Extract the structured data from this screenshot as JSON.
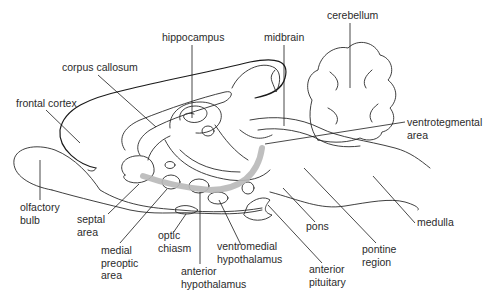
{
  "diagram": {
    "type": "labeled anatomical line drawing (sagittal brain section)",
    "pathway_color": "#b8b8b8",
    "line_color": "#2a2a2a",
    "labels": {
      "cerebellum": [
        "cerebellum"
      ],
      "hippocampus": [
        "hippocampus"
      ],
      "midbrain": [
        "midbrain"
      ],
      "corpus_callosum": [
        "corpus callosum"
      ],
      "frontal_cortex": [
        "frontal cortex"
      ],
      "ventrotegmental_area": [
        "ventrotegmental",
        "area"
      ],
      "olfactory_bulb": [
        "olfactory",
        "bulb"
      ],
      "septal_area": [
        "septal",
        "area"
      ],
      "medial_preoptic_area": [
        "medial",
        "preoptic",
        "area"
      ],
      "optic_chiasm": [
        "optic",
        "chiasm"
      ],
      "ventromedial_hypothalamus": [
        "ventromedial",
        "hypothalamus"
      ],
      "anterior_hypothalamus": [
        "anterior",
        "hypothalamus"
      ],
      "anterior_pituitary": [
        "anterior",
        "pituitary"
      ],
      "pons": [
        "pons"
      ],
      "pontine_region": [
        "pontine",
        "region"
      ],
      "medulla": [
        "medulla"
      ]
    }
  }
}
